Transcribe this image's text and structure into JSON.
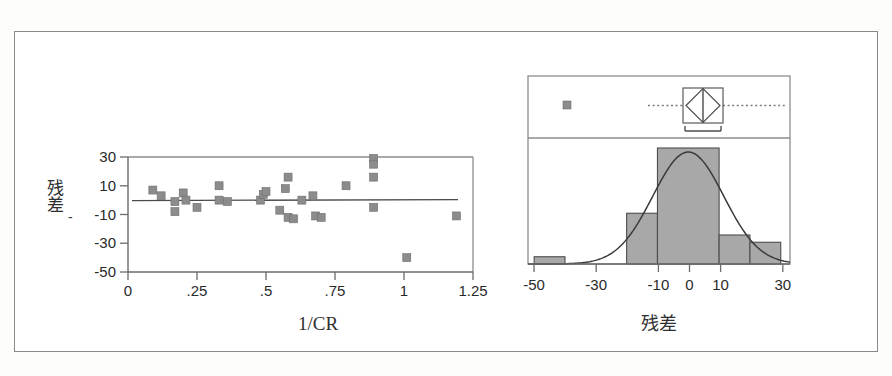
{
  "figure": {
    "caption": "",
    "panels": [
      "residual-scatter",
      "residual-distribution"
    ]
  },
  "scatter_panel": {
    "xlabel": "1/CR",
    "ylabel": "残差",
    "ylabel_chars": [
      "残",
      "差"
    ],
    "ylabel_dash": "-",
    "xticks": [
      "0",
      ".25",
      ".5",
      ".75",
      "1",
      "1.25"
    ],
    "yticks": [
      "30",
      "10",
      "-10",
      "-30",
      "-50"
    ]
  },
  "dist_panel": {
    "xlabel": "残差",
    "xticks": [
      "-50",
      "-30",
      "-10",
      "0",
      "10",
      "30"
    ]
  },
  "chart_data": [
    {
      "type": "scatter",
      "id": "residual-vs-inverse-cr",
      "title": "",
      "xlabel": "1/CR",
      "ylabel": "残差",
      "xlim": [
        0,
        1.25
      ],
      "ylim": [
        -50,
        30
      ],
      "xticks": [
        0,
        0.25,
        0.5,
        0.75,
        1,
        1.25
      ],
      "xticklabels": [
        "0",
        ".25",
        ".5",
        ".75",
        "1",
        "1.25"
      ],
      "yticks": [
        30,
        10,
        -10,
        -30,
        -50
      ],
      "yticklabels": [
        "30",
        "10",
        "-10",
        "-30",
        "-50"
      ],
      "grid": false,
      "legend": null,
      "reference_line": {
        "type": "horizontal",
        "y": 0,
        "label": ""
      },
      "points": [
        {
          "x": 0.09,
          "y": 7
        },
        {
          "x": 0.12,
          "y": 3
        },
        {
          "x": 0.17,
          "y": -1
        },
        {
          "x": 0.17,
          "y": -8
        },
        {
          "x": 0.2,
          "y": 5
        },
        {
          "x": 0.21,
          "y": 0
        },
        {
          "x": 0.25,
          "y": -5
        },
        {
          "x": 0.33,
          "y": 10
        },
        {
          "x": 0.33,
          "y": 0
        },
        {
          "x": 0.36,
          "y": -1
        },
        {
          "x": 0.48,
          "y": 0
        },
        {
          "x": 0.49,
          "y": 4
        },
        {
          "x": 0.5,
          "y": 6
        },
        {
          "x": 0.55,
          "y": -7
        },
        {
          "x": 0.57,
          "y": 8
        },
        {
          "x": 0.58,
          "y": 16
        },
        {
          "x": 0.58,
          "y": -12
        },
        {
          "x": 0.6,
          "y": -13
        },
        {
          "x": 0.63,
          "y": 0
        },
        {
          "x": 0.67,
          "y": 3
        },
        {
          "x": 0.68,
          "y": -11
        },
        {
          "x": 0.7,
          "y": -12
        },
        {
          "x": 0.79,
          "y": 10
        },
        {
          "x": 0.89,
          "y": 29
        },
        {
          "x": 0.89,
          "y": 25
        },
        {
          "x": 0.89,
          "y": 16
        },
        {
          "x": 0.89,
          "y": -5
        },
        {
          "x": 1.01,
          "y": -40
        },
        {
          "x": 1.19,
          "y": -11
        }
      ]
    },
    {
      "type": "histogram",
      "id": "residual-distribution",
      "title": "",
      "xlabel": "残差",
      "ylabel": "",
      "xlim": [
        -52,
        33
      ],
      "xticks": [
        -50,
        -30,
        -10,
        0,
        10,
        30
      ],
      "xticklabels": [
        "-50",
        "-30",
        "-10",
        "0",
        "10",
        "30"
      ],
      "grid": false,
      "bins": [
        {
          "start": -50,
          "end": -40,
          "count": 1
        },
        {
          "start": -40,
          "end": -20,
          "count": 0
        },
        {
          "start": -20,
          "end": -10,
          "count": 7
        },
        {
          "start": -10,
          "end": 10,
          "count": 16
        },
        {
          "start": 10,
          "end": 20,
          "count": 4
        },
        {
          "start": 20,
          "end": 30,
          "count": 3
        }
      ],
      "normal_curve": {
        "mean": 0,
        "sd": 11.5,
        "shown": true
      },
      "boxplot": {
        "median": 0,
        "q1": -6.5,
        "q3": 6.0,
        "whisker_low": -14,
        "whisker_high": 30,
        "mean_diamond": {
          "center": 0,
          "low": -7.5,
          "high": 7.5
        },
        "outliers": [
          -40
        ],
        "shortest_half": {
          "start": -7.0,
          "end": 6.0
        }
      }
    }
  ]
}
